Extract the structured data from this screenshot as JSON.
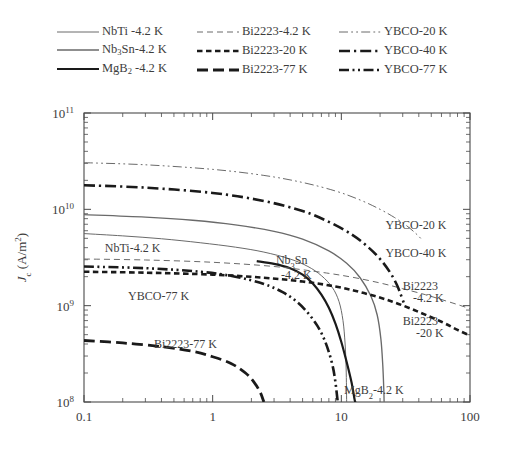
{
  "legend": {
    "rows": [
      [
        {
          "key": "nbti",
          "label": "NbTi -4.2 K",
          "style": "solid-thin",
          "color": "#6a6a6a"
        },
        {
          "key": "bi2223_42",
          "label": "Bi2223-4.2 K",
          "style": "dashed-thin",
          "color": "#6a6a6a"
        },
        {
          "key": "ybco_20",
          "label": "YBCO-20 K",
          "style": "dashdotdot-thin",
          "color": "#6a6a6a"
        }
      ],
      [
        {
          "key": "nb3sn",
          "label": "Nb3Sn-4.2 K",
          "label_html": "Nb<sub>3</sub>Sn-4.2 K",
          "style": "solid-med",
          "color": "#6a6a6a"
        },
        {
          "key": "bi2223_20",
          "label": "Bi2223-20 K",
          "style": "dashed-short-bold",
          "color": "#1a1a1a"
        },
        {
          "key": "ybco_40",
          "label": "YBCO-40 K",
          "style": "dashdot-bold",
          "color": "#1a1a1a"
        }
      ],
      [
        {
          "key": "mgb2",
          "label": "MgB2 -4.2 K",
          "label_html": "MgB<sub>2</sub> -4.2 K",
          "style": "solid-bold",
          "color": "#1a1a1a"
        },
        {
          "key": "bi2223_77",
          "label": "Bi2223-77 K",
          "style": "dashed-long-bold",
          "color": "#1a1a1a"
        },
        {
          "key": "ybco_77",
          "label": "YBCO-77 K",
          "style": "dashdotdot-bold",
          "color": "#1a1a1a"
        }
      ]
    ]
  },
  "axes": {
    "xlabel": "B(T)",
    "ylabel_main": "J",
    "ylabel_sub": "c",
    "ylabel_rest": " (A/m",
    "ylabel_sup": "2",
    "ylabel_close": ")",
    "x_ticks": [
      {
        "value": 0.1,
        "label": "0.1"
      },
      {
        "value": 1,
        "label": "1"
      },
      {
        "value": 10,
        "label": "10"
      },
      {
        "value": 100,
        "label": "100"
      }
    ],
    "y_ticks": [
      {
        "value": 100000000.0,
        "mant": "10",
        "exp": "8"
      },
      {
        "value": 1000000000.0,
        "mant": "10",
        "exp": "9"
      },
      {
        "value": 10000000000.0,
        "mant": "10",
        "exp": "10"
      },
      {
        "value": 100000000000.0,
        "mant": "10",
        "exp": "11"
      }
    ],
    "xlim": [
      0.1,
      100
    ],
    "ylim": [
      100000000.0,
      100000000000.0
    ],
    "xscale": "log",
    "yscale": "log",
    "grid": false
  },
  "annotations": [
    {
      "key": "nbti",
      "text": "NbTi-4.2 K",
      "x": 0.145,
      "y": 3600000000.0,
      "anchor": "start"
    },
    {
      "key": "ybco_77",
      "text": "YBCO-77 K",
      "x": 0.22,
      "y": 1150000000.0,
      "anchor": "start"
    },
    {
      "key": "bi2223_77",
      "text": "Bi2223-77 K",
      "x": 0.35,
      "y": 360000000.0,
      "anchor": "start"
    },
    {
      "key": "nb3sn_l1",
      "text": "Nb3Sn",
      "text_html": "Nb<tspan baseline-shift='sub' font-size='8.5'>3</tspan>Sn",
      "x": 3.1,
      "y": 2700000000.0,
      "anchor": "start"
    },
    {
      "key": "nb3sn_l2",
      "text": "-4.2 K",
      "x": 3.4,
      "y": 1900000000.0,
      "anchor": "start"
    },
    {
      "key": "mgb2",
      "text": "MgB2-4.2 K",
      "text_html": "MgB<tspan baseline-shift='sub' font-size='8.5'>2</tspan>-4.2 K",
      "x": 10.5,
      "y": 122000000.0,
      "anchor": "start"
    },
    {
      "key": "ybco_20",
      "text": "YBCO-20 K",
      "x": 22,
      "y": 6200000000.0,
      "anchor": "start"
    },
    {
      "key": "ybco_40",
      "text": "YBCO-40 K",
      "x": 22,
      "y": 3200000000.0,
      "anchor": "start"
    },
    {
      "key": "bi2223_42a",
      "text": "Bi2223",
      "x": 30,
      "y": 1450000000.0,
      "anchor": "start"
    },
    {
      "key": "bi2223_42b",
      "text": "-4.2 K",
      "x": 36,
      "y": 1080000000.0,
      "anchor": "start"
    },
    {
      "key": "bi2223_20a",
      "text": "Bi2223",
      "x": 30,
      "y": 630000000.0,
      "anchor": "start"
    },
    {
      "key": "bi2223_20b",
      "text": "-20 K",
      "x": 38,
      "y": 470000000.0,
      "anchor": "start"
    }
  ],
  "chart_data": {
    "type": "line",
    "title": "",
    "xlabel": "B(T)",
    "ylabel": "Jc (A/m2)",
    "xscale": "log",
    "yscale": "log",
    "xlim": [
      0.1,
      100
    ],
    "ylim": [
      100000000,
      100000000000
    ],
    "grid": false,
    "legend_position": "above-plot",
    "series": [
      {
        "name": "NbTi -4.2 K",
        "style": "solid-thin",
        "color": "#6a6a6a",
        "points": [
          [
            0.1,
            5600000000.0
          ],
          [
            0.2,
            5300000000.0
          ],
          [
            0.4,
            4950000000.0
          ],
          [
            0.8,
            4500000000.0
          ],
          [
            1.5,
            4050000000.0
          ],
          [
            2.5,
            3600000000.0
          ],
          [
            4.0,
            3050000000.0
          ],
          [
            5.5,
            2550000000.0
          ],
          [
            7.0,
            2050000000.0
          ],
          [
            8.5,
            1550000000.0
          ],
          [
            9.6,
            1100000000.0
          ],
          [
            10.3,
            700000000.0
          ],
          [
            10.7,
            400000000.0
          ],
          [
            10.9,
            220000000.0
          ],
          [
            11.0,
            100000000.0
          ]
        ]
      },
      {
        "name": "Nb3Sn-4.2 K",
        "style": "solid-med",
        "color": "#6a6a6a",
        "points": [
          [
            0.1,
            8800000000.0
          ],
          [
            0.3,
            8300000000.0
          ],
          [
            0.7,
            7700000000.0
          ],
          [
            1.5,
            6900000000.0
          ],
          [
            3.0,
            5900000000.0
          ],
          [
            5.0,
            4900000000.0
          ],
          [
            8.0,
            3700000000.0
          ],
          [
            11.0,
            2750000000.0
          ],
          [
            14.0,
            1950000000.0
          ],
          [
            17.0,
            1250000000.0
          ],
          [
            19.0,
            800000000.0
          ],
          [
            20.3,
            450000000.0
          ],
          [
            21.0,
            240000000.0
          ],
          [
            21.4,
            130000000.0
          ],
          [
            21.5,
            100000000.0
          ]
        ]
      },
      {
        "name": "MgB2 -4.2 K",
        "style": "solid-bold",
        "color": "#1a1a1a",
        "points": [
          [
            2.2,
            2900000000.0
          ],
          [
            3.0,
            2720000000.0
          ],
          [
            4.0,
            2450000000.0
          ],
          [
            5.0,
            2100000000.0
          ],
          [
            6.0,
            1700000000.0
          ],
          [
            7.0,
            1300000000.0
          ],
          [
            8.0,
            950000000.0
          ],
          [
            9.0,
            650000000.0
          ],
          [
            10.0,
            420000000.0
          ],
          [
            11.0,
            260000000.0
          ],
          [
            12.0,
            160000000.0
          ],
          [
            12.7,
            105000000.0
          ],
          [
            12.9,
            100000000.0
          ]
        ]
      },
      {
        "name": "Bi2223-4.2 K",
        "style": "dashed-thin",
        "color": "#6a6a6a",
        "points": [
          [
            0.1,
            3050000000.0
          ],
          [
            0.3,
            2980000000.0
          ],
          [
            1.0,
            2820000000.0
          ],
          [
            3.0,
            2550000000.0
          ],
          [
            7.0,
            2220000000.0
          ],
          [
            12.0,
            1980000000.0
          ],
          [
            20.0,
            1720000000.0
          ],
          [
            30.0,
            1500000000.0
          ],
          [
            45.0,
            1300000000.0
          ],
          [
            65.0,
            1120000000.0
          ],
          [
            85.0,
            1000000000.0
          ],
          [
            100.0,
            930000000.0
          ]
        ]
      },
      {
        "name": "Bi2223-20 K",
        "style": "dashed-short-bold",
        "color": "#1a1a1a",
        "points": [
          [
            0.1,
            2250000000.0
          ],
          [
            0.3,
            2200000000.0
          ],
          [
            1.0,
            2100000000.0
          ],
          [
            2.5,
            1950000000.0
          ],
          [
            5.0,
            1780000000.0
          ],
          [
            9.0,
            1580000000.0
          ],
          [
            15.0,
            1350000000.0
          ],
          [
            25.0,
            1100000000.0
          ],
          [
            40.0,
            860000000.0
          ],
          [
            60.0,
            680000000.0
          ],
          [
            80.0,
            560000000.0
          ],
          [
            100.0,
            490000000.0
          ]
        ]
      },
      {
        "name": "Bi2223-77 K",
        "style": "dashed-long-bold",
        "color": "#1a1a1a",
        "points": [
          [
            0.1,
            435000000.0
          ],
          [
            0.2,
            410000000.0
          ],
          [
            0.4,
            375000000.0
          ],
          [
            0.7,
            335000000.0
          ],
          [
            1.0,
            295000000.0
          ],
          [
            1.4,
            250000000.0
          ],
          [
            1.8,
            200000000.0
          ],
          [
            2.1,
            160000000.0
          ],
          [
            2.35,
            125000000.0
          ],
          [
            2.5,
            100000000.0
          ]
        ]
      },
      {
        "name": "YBCO-20 K",
        "style": "dashdotdot-thin",
        "color": "#6a6a6a",
        "points": [
          [
            0.1,
            30500000000.0
          ],
          [
            0.3,
            29000000000.0
          ],
          [
            1.0,
            26000000000.0
          ],
          [
            2.5,
            22500000000.0
          ],
          [
            5.0,
            19000000000.0
          ],
          [
            9.0,
            15500000000.0
          ],
          [
            14.0,
            12500000000.0
          ],
          [
            20.0,
            10000000000.0
          ],
          [
            26.0,
            8200000000.0
          ],
          [
            32.0,
            6800000000.0
          ],
          [
            38.0,
            5600000000.0
          ],
          [
            42.0,
            4900000000.0
          ]
        ]
      },
      {
        "name": "YBCO-40 K",
        "style": "dashdot-bold",
        "color": "#1a1a1a",
        "points": [
          [
            0.1,
            17800000000.0
          ],
          [
            0.3,
            16800000000.0
          ],
          [
            1.0,
            14800000000.0
          ],
          [
            2.5,
            12200000000.0
          ],
          [
            5.0,
            9600000000.0
          ],
          [
            8.0,
            7400000000.0
          ],
          [
            12.0,
            5500000000.0
          ],
          [
            16.0,
            4100000000.0
          ],
          [
            20.0,
            3050000000.0
          ],
          [
            24.0,
            2200000000.0
          ],
          [
            27.0,
            1650000000.0
          ],
          [
            29.0,
            1300000000.0
          ],
          [
            30.5,
            1080000000.0
          ]
        ]
      },
      {
        "name": "YBCO-77 K",
        "style": "dashdotdot-bold",
        "color": "#1a1a1a",
        "points": [
          [
            0.1,
            2550000000.0
          ],
          [
            0.3,
            2450000000.0
          ],
          [
            0.8,
            2250000000.0
          ],
          [
            1.5,
            2000000000.0
          ],
          [
            2.5,
            1680000000.0
          ],
          [
            3.5,
            1380000000.0
          ],
          [
            4.5,
            1100000000.0
          ],
          [
            5.5,
            840000000.0
          ],
          [
            6.5,
            620000000.0
          ],
          [
            7.3,
            460000000.0
          ],
          [
            8.0,
            330000000.0
          ],
          [
            8.6,
            230000000.0
          ],
          [
            9.0,
            160000000.0
          ],
          [
            9.3,
            110000000.0
          ],
          [
            9.4,
            100000000.0
          ]
        ]
      }
    ]
  }
}
